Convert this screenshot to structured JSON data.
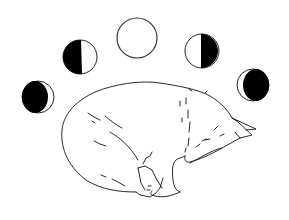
{
  "illustration": {
    "subject": "sleeping cat curled up under moon phases",
    "background_color": "#ffffff",
    "line_color": "#111111",
    "fill_color": "#000000",
    "moons": [
      {
        "name": "waning-gibbous-dark",
        "phase": "mostly dark, light crescent on right",
        "cx": 38,
        "cy": 97,
        "r": 16
      },
      {
        "name": "first-quarter-dark-left",
        "phase": "left half dark",
        "cx": 80,
        "cy": 57,
        "r": 17
      },
      {
        "name": "full-moon",
        "phase": "full (empty circle)",
        "cx": 137,
        "cy": 38,
        "r": 20
      },
      {
        "name": "last-quarter-dark-right",
        "phase": "right half dark",
        "cx": 202,
        "cy": 51,
        "r": 17
      },
      {
        "name": "waxing-dark",
        "phase": "mostly dark, light crescent on left",
        "cx": 253,
        "cy": 85,
        "r": 16
      }
    ]
  }
}
